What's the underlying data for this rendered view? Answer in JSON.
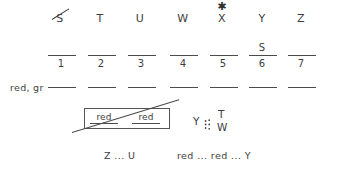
{
  "worksheet": {
    "letter_row": {
      "items": [
        {
          "label": "S",
          "crossed_out": true,
          "starred": false,
          "x": 60
        },
        {
          "label": "T",
          "crossed_out": false,
          "starred": false,
          "x": 100
        },
        {
          "label": "U",
          "crossed_out": false,
          "starred": false,
          "x": 140
        },
        {
          "label": "W",
          "crossed_out": false,
          "starred": false,
          "x": 183
        },
        {
          "label": "X",
          "crossed_out": false,
          "starred": true,
          "x": 222
        },
        {
          "label": "Y",
          "crossed_out": false,
          "starred": false,
          "x": 262
        },
        {
          "label": "Z",
          "crossed_out": false,
          "starred": false,
          "x": 301
        }
      ],
      "star_glyph": "✱"
    },
    "numbered_row": {
      "blanks": [
        {
          "number": "1",
          "above": "",
          "x": 62,
          "width": 28
        },
        {
          "number": "2",
          "above": "",
          "x": 102,
          "width": 28
        },
        {
          "number": "3",
          "above": "",
          "x": 142,
          "width": 28
        },
        {
          "number": "4",
          "above": "",
          "x": 184,
          "width": 28
        },
        {
          "number": "5",
          "above": "",
          "x": 224,
          "width": 28
        },
        {
          "number": "6",
          "above": "S",
          "x": 263,
          "width": 28
        },
        {
          "number": "7",
          "above": "",
          "x": 302,
          "width": 28
        }
      ],
      "line_y": 55,
      "number_y": 58
    },
    "labeled_row": {
      "label": "red, gr",
      "label_x": 10,
      "label_y": 82,
      "blanks": [
        {
          "x": 62,
          "width": 28
        },
        {
          "x": 102,
          "width": 28
        },
        {
          "x": 142,
          "width": 28
        },
        {
          "x": 184,
          "width": 28
        },
        {
          "x": 224,
          "width": 28
        },
        {
          "x": 263,
          "width": 28
        },
        {
          "x": 302,
          "width": 28
        }
      ],
      "line_y": 87
    },
    "crossed_box": {
      "words": [
        {
          "text": "red",
          "x": 90
        },
        {
          "text": "red",
          "x": 132
        }
      ],
      "struck_through": true
    },
    "branch_group": {
      "root": "Y",
      "top_branch": "T",
      "bottom_branch": "W"
    },
    "bottom_row": {
      "items": [
        {
          "text": "Z ... U",
          "x": 104
        },
        {
          "text": "red ... red ... Y",
          "x": 177
        }
      ]
    }
  },
  "colors": {
    "ink": "#3d3d3d",
    "rule": "#4a4a4a",
    "background": "#ffffff"
  }
}
